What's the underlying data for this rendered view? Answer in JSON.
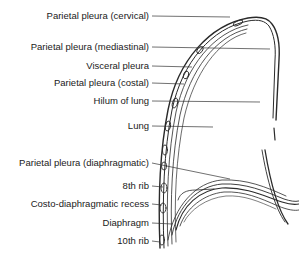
{
  "diagram": {
    "labels": [
      {
        "id": "parietal-cervical",
        "text": "Parietal pleura (cervical)",
        "right": 150,
        "y": 10,
        "line_to": [
          230,
          17
        ]
      },
      {
        "id": "parietal-mediastinal",
        "text": "Parietal pleura (mediastinal)",
        "right": 150,
        "y": 41,
        "line_to": [
          270,
          49
        ]
      },
      {
        "id": "visceral",
        "text": "Visceral pleura",
        "right": 150,
        "y": 60,
        "line_to": [
          190,
          67
        ]
      },
      {
        "id": "parietal-costal",
        "text": "Parietal pleura (costal)",
        "right": 150,
        "y": 77,
        "line_to": [
          185,
          84
        ]
      },
      {
        "id": "hilum",
        "text": "Hilum of lung",
        "right": 150,
        "y": 95,
        "line_to": [
          260,
          102
        ]
      },
      {
        "id": "lung",
        "text": "Lung",
        "right": 150,
        "y": 120,
        "line_to": [
          213,
          127
        ]
      },
      {
        "id": "parietal-diaphragmatic",
        "text": "Parietal pleura (diaphragmatic)",
        "right": 150,
        "y": 157,
        "line_to": [
          222,
          178
        ]
      },
      {
        "id": "rib-8",
        "text": "8th rib",
        "right": 150,
        "y": 180,
        "line_to": [
          163,
          187
        ]
      },
      {
        "id": "costo-recess",
        "text": "Costo-diaphragmatic recess",
        "right": 150,
        "y": 198,
        "line_to": [
          160,
          205
        ]
      },
      {
        "id": "diaphragm",
        "text": "Diaphragm",
        "right": 150,
        "y": 217,
        "line_to": [
          170,
          224
        ]
      },
      {
        "id": "rib-10",
        "text": "10th rib",
        "right": 150,
        "y": 235,
        "line_to": [
          160,
          242
        ]
      }
    ],
    "colors": {
      "ink": "#1a1a1a",
      "line": "#333333",
      "background": "#ffffff"
    }
  }
}
